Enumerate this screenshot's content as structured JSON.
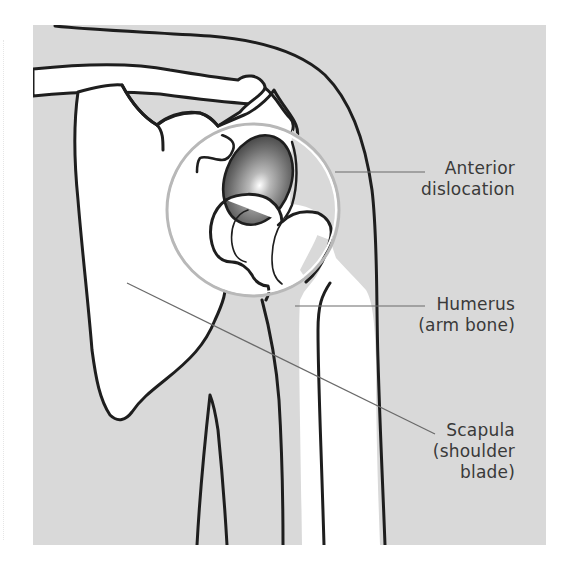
{
  "figure": {
    "background_color": "#d9d9d9",
    "bone_color": "#ffffff",
    "outline_color": "#1e1e1e",
    "leader_color": "#6a6a6a",
    "magnifier_ring_color": "#b5b5b5",
    "dislocated_head_color": "#6b6b6b"
  },
  "labels": [
    {
      "id": "anterior-dislocation",
      "line1": "Anterior",
      "line2": "dislocation",
      "line3": ""
    },
    {
      "id": "humerus",
      "line1": "Humerus",
      "line2": "(arm bone)",
      "line3": ""
    },
    {
      "id": "scapula",
      "line1": "Scapula",
      "line2": "(shoulder",
      "line3": "blade)"
    }
  ],
  "structures": [
    {
      "name": "clavicle"
    },
    {
      "name": "acromion"
    },
    {
      "name": "scapula"
    },
    {
      "name": "glenoid"
    },
    {
      "name": "humeral-head"
    },
    {
      "name": "humerus"
    },
    {
      "name": "arm-outline"
    },
    {
      "name": "magnifier-circle"
    }
  ]
}
